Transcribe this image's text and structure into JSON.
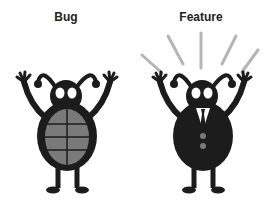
{
  "labels": {
    "bug": "Bug",
    "feature": "Feature"
  },
  "colors": {
    "ink": "#1c1c1c",
    "shell": "#7a7a7a",
    "rays": "#b5b5b5",
    "eyes": "#ffffff",
    "background": "#ffffff"
  },
  "icons": {
    "bug": "bug-with-shell-icon",
    "feature": "bug-in-suit-icon"
  }
}
